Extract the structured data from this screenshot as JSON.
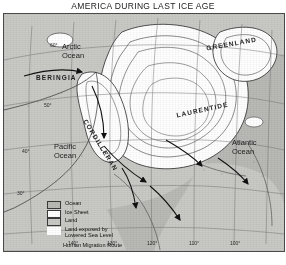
{
  "title": "AMERICA DURING LAST ICE AGE",
  "map": {
    "ocean_labels": [
      {
        "name": "arctic-ocean",
        "line1": "Arctic",
        "line2": "Ocean"
      },
      {
        "name": "pacific-ocean",
        "line1": "Pacific",
        "line2": "Ocean"
      },
      {
        "name": "atlantic-ocean",
        "line1": "Atlantic",
        "line2": "Ocean"
      }
    ],
    "region_labels": [
      {
        "name": "greenland",
        "text": "GREENLAND"
      },
      {
        "name": "laurentide",
        "text": "LAURENTIDE"
      },
      {
        "name": "cordilleran",
        "text": "CORDILLERAN"
      },
      {
        "name": "beringia",
        "text": "BERINGIA"
      }
    ],
    "latitude_ticks": [
      "60°",
      "50°",
      "40°",
      "30°"
    ],
    "longitude_ticks": [
      "140°",
      "130°",
      "120°",
      "110°",
      "100°"
    ]
  },
  "legend": {
    "items": [
      {
        "name": "ocean",
        "label": "Ocean",
        "swatch": "sw-ocean"
      },
      {
        "name": "ice-sheet",
        "label": "Ice Sheet",
        "swatch": "sw-ice"
      },
      {
        "name": "land",
        "label": "Land",
        "swatch": "sw-land"
      },
      {
        "name": "land-exposed",
        "label": "Land exposed by",
        "label2": "Lowered Sea Level",
        "swatch": "sw-exposed"
      },
      {
        "name": "migration",
        "label": "Human Migration Route",
        "swatch": "arrow"
      }
    ]
  },
  "colors": {
    "ocean": "#b9b9b6",
    "land": "#c9c9c6",
    "ice": "#ffffff",
    "ink": "#1d1d1d"
  }
}
